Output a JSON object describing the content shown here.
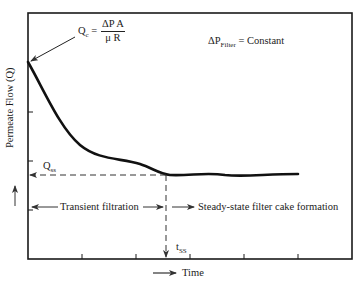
{
  "figure": {
    "type": "diagram",
    "y_axis": {
      "label": "Permeate Flow (Q)",
      "arrow": "up-arrow"
    },
    "x_axis": {
      "label": "Time",
      "arrow": "right-arrow"
    },
    "annotations": {
      "qc": {
        "symbol": "Q",
        "subscript": "c",
        "equals": "=",
        "numerator": "ΔP A",
        "denominator": "μ R"
      },
      "pressure": {
        "symbol": "ΔP",
        "subscript": "Filter",
        "rest": " = Constant"
      },
      "qss": {
        "symbol": "Q",
        "subscript": "ss"
      },
      "tss": {
        "symbol": "t",
        "subscript": "SS"
      },
      "transient": "Transient filtration",
      "steady": "Steady-state filter cake formation"
    },
    "curve": {
      "description": "Permeate flow decays from initial Qc to steady-state Qss at tss",
      "points_px": [
        [
          28,
          62
        ],
        [
          55,
          110
        ],
        [
          85,
          150
        ],
        [
          115,
          160
        ],
        [
          145,
          168
        ],
        [
          166,
          174
        ],
        [
          200,
          172
        ],
        [
          235,
          175
        ],
        [
          270,
          174
        ],
        [
          298,
          174
        ]
      ]
    },
    "x_ticks_px": [
      82,
      136,
      190,
      244,
      298
    ],
    "y_ticks_px": [
      112,
      161,
      210
    ],
    "colors": {
      "line": "#111111",
      "frame": "#1a1a1a",
      "dash": "#333333"
    }
  }
}
